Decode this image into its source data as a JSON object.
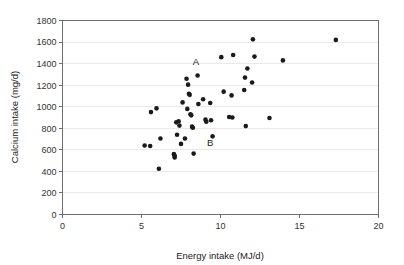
{
  "chart_data": {
    "type": "scatter",
    "title": "",
    "xlabel": "Energy intake (MJ/d)",
    "ylabel": "Calcium intake (mg/d)",
    "xlim": [
      0,
      20
    ],
    "ylim": [
      0,
      1800
    ],
    "xticks": [
      "0",
      "5",
      "10",
      "15",
      "20"
    ],
    "xtick_values": [
      0,
      5,
      10,
      15,
      20
    ],
    "yticks": [
      "0",
      "200",
      "400",
      "600",
      "800",
      "1000",
      "1200",
      "1400",
      "1600",
      "1800"
    ],
    "ytick_values": [
      0,
      200,
      400,
      600,
      800,
      1000,
      1200,
      1400,
      1600,
      1800
    ],
    "grid": "horizontal",
    "legend": "none",
    "marker": "filled-circle",
    "marker_color": "#1a1a1a",
    "series": [
      {
        "name": "subjects",
        "points": [
          [
            5.2,
            640
          ],
          [
            5.55,
            635
          ],
          [
            5.6,
            950
          ],
          [
            5.95,
            985
          ],
          [
            6.1,
            425
          ],
          [
            6.2,
            705
          ],
          [
            7.05,
            560
          ],
          [
            7.1,
            545
          ],
          [
            7.1,
            530
          ],
          [
            7.2,
            855
          ],
          [
            7.25,
            740
          ],
          [
            7.35,
            865
          ],
          [
            7.4,
            825
          ],
          [
            7.5,
            655
          ],
          [
            7.6,
            1040
          ],
          [
            7.75,
            705
          ],
          [
            7.85,
            1260
          ],
          [
            7.9,
            980
          ],
          [
            7.95,
            1205
          ],
          [
            8.0,
            1120
          ],
          [
            8.05,
            1110
          ],
          [
            8.1,
            930
          ],
          [
            8.15,
            920
          ],
          [
            8.2,
            815
          ],
          [
            8.25,
            805
          ],
          [
            8.3,
            565
          ],
          [
            8.55,
            1290
          ],
          [
            8.6,
            1025
          ],
          [
            8.9,
            1070
          ],
          [
            9.05,
            880
          ],
          [
            9.1,
            860
          ],
          [
            9.35,
            1035
          ],
          [
            9.4,
            875
          ],
          [
            9.5,
            725
          ],
          [
            10.05,
            1460
          ],
          [
            10.2,
            1140
          ],
          [
            10.55,
            905
          ],
          [
            10.7,
            1105
          ],
          [
            10.75,
            900
          ],
          [
            10.8,
            1480
          ],
          [
            11.5,
            1155
          ],
          [
            11.55,
            1270
          ],
          [
            11.6,
            820
          ],
          [
            11.7,
            1355
          ],
          [
            12.0,
            1225
          ],
          [
            12.05,
            1625
          ],
          [
            12.15,
            1465
          ],
          [
            13.1,
            895
          ],
          [
            13.95,
            1430
          ],
          [
            17.3,
            1620
          ]
        ]
      }
    ],
    "annotations": [
      {
        "label": "A",
        "x": 8.45,
        "y": 1390
      },
      {
        "label": "B",
        "x": 9.35,
        "y": 635
      }
    ]
  }
}
